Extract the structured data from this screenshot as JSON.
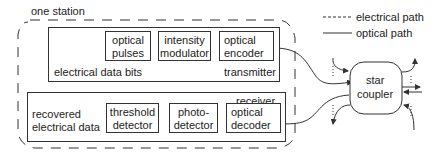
{
  "diagram": {
    "station_label": "one station",
    "legend": {
      "electrical": "electrical path",
      "optical": "optical path"
    },
    "transmitter": {
      "label": "transmitter",
      "input_label": "electrical data bits",
      "blocks": [
        {
          "line1": "optical",
          "line2": "pulses"
        },
        {
          "line1": "intensity",
          "line2": "modulator"
        },
        {
          "line1": "optical",
          "line2": "encoder"
        }
      ]
    },
    "receiver": {
      "label": "receiver",
      "output_label_1": "recovered",
      "output_label_2": "electrical data",
      "blocks": [
        {
          "line1": "threshold",
          "line2": "detector"
        },
        {
          "line1": "photo-",
          "line2": "detector"
        },
        {
          "line1": "optical",
          "line2": "decoder"
        }
      ]
    },
    "star_coupler": {
      "line1": "star",
      "line2": "coupler"
    },
    "colors": {
      "line": "#333333",
      "background": "#ffffff"
    }
  }
}
